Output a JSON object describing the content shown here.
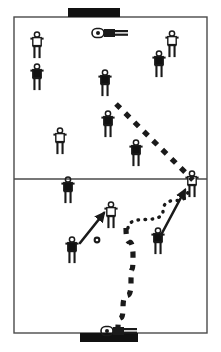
{
  "diagram": {
    "type": "field-diagram",
    "sport": "soccer",
    "canvas": {
      "width": 221,
      "height": 352
    },
    "colors": {
      "ink": "#1a1a1a",
      "field": "#ffffff",
      "line": "#4a4a4a",
      "goal": "#111111",
      "team_dark": "#111111",
      "team_light": "#ffffff"
    },
    "field": {
      "outline": {
        "x": 14,
        "y": 17,
        "width": 193,
        "height": 316
      },
      "halfway_line_y": 179
    },
    "goals": [
      {
        "name": "top-goal",
        "x": 68,
        "y": 8,
        "width": 52,
        "height": 9
      },
      {
        "name": "bottom-goal",
        "x": 80,
        "y": 333,
        "width": 58,
        "height": 9
      }
    ],
    "goalkeepers": [
      {
        "name": "top-goalkeeper",
        "x": 94,
        "y": 33,
        "facing": "right"
      },
      {
        "name": "bottom-goalkeeper",
        "x": 103,
        "y": 331,
        "facing": "right"
      }
    ],
    "ball": {
      "name": "ball",
      "x": 97,
      "y": 240,
      "radius": 3.4
    },
    "players": [
      {
        "id": "p1",
        "team": "light",
        "x": 37,
        "y": 47
      },
      {
        "id": "p2",
        "team": "dark",
        "x": 37,
        "y": 79
      },
      {
        "id": "p3",
        "team": "dark",
        "x": 105,
        "y": 85
      },
      {
        "id": "p4",
        "team": "dark",
        "x": 159,
        "y": 66
      },
      {
        "id": "p5",
        "team": "light",
        "x": 172,
        "y": 46
      },
      {
        "id": "p6",
        "team": "dark",
        "x": 108,
        "y": 126
      },
      {
        "id": "p7",
        "team": "light",
        "x": 60,
        "y": 143
      },
      {
        "id": "p8",
        "team": "dark",
        "x": 136,
        "y": 155
      },
      {
        "id": "p9",
        "team": "dark",
        "x": 68,
        "y": 192
      },
      {
        "id": "p10",
        "team": "light",
        "x": 111,
        "y": 217
      },
      {
        "id": "p11",
        "team": "light",
        "x": 192,
        "y": 186
      },
      {
        "id": "p12",
        "team": "dark",
        "x": 72,
        "y": 252
      },
      {
        "id": "p13",
        "team": "dark",
        "x": 158,
        "y": 243
      }
    ],
    "paths": [
      {
        "name": "dashed-run-upper",
        "style": "dashed",
        "points": [
          [
            116,
            104
          ],
          [
            193,
            180
          ]
        ]
      },
      {
        "name": "dashed-pass-to-goal",
        "style": "dashed",
        "points": [
          [
            126,
            228
          ],
          [
            133,
            256
          ],
          [
            131,
            283
          ],
          [
            123,
            308
          ],
          [
            118,
            328
          ]
        ]
      },
      {
        "name": "dotted-pass",
        "style": "dotted",
        "points": [
          [
            128,
            228
          ],
          [
            163,
            211
          ],
          [
            188,
            190
          ]
        ]
      },
      {
        "name": "arrow-run-left",
        "style": "arrow",
        "points": [
          [
            80,
            243
          ],
          [
            104,
            213
          ]
        ]
      },
      {
        "name": "arrow-run-right",
        "style": "arrow",
        "points": [
          [
            161,
            235
          ],
          [
            185,
            190
          ]
        ]
      }
    ],
    "legend": {
      "dashed_label": "ball path / run",
      "dotted_label": "pass",
      "arrow_label": "player movement"
    }
  }
}
